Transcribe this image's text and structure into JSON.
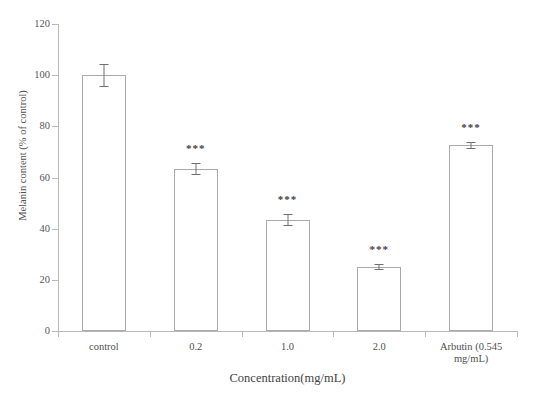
{
  "chart_data": {
    "type": "bar",
    "title": "",
    "xlabel": "Concentration(mg/mL)",
    "ylabel": "Melanin content  (% of control)",
    "categories": [
      "control",
      "0.2",
      "1.0",
      "2.0",
      "Arbutin  (0.545 mg/mL)"
    ],
    "values": [
      100,
      63.5,
      43.5,
      25.2,
      72.7
    ],
    "errors": [
      4.2,
      2.0,
      2.2,
      1.0,
      1.0
    ],
    "annotations": [
      "",
      "***",
      "***",
      "***",
      "***"
    ],
    "ylim": [
      0,
      120
    ],
    "yticks": [
      0,
      20,
      40,
      60,
      80,
      100,
      120
    ],
    "ytick_labels": [
      "0",
      "20",
      "40",
      "60",
      "80",
      "100",
      "120"
    ],
    "grid": false,
    "legend": null,
    "bar_fill": "#ffffff",
    "bar_edge": "#a9a9a9",
    "axis_color": "#b9b9b9",
    "text_color": "#4f4f4f"
  },
  "axis": {
    "x_title": "Concentration(mg/mL)",
    "y_title": "Melanin content  (% of control)"
  },
  "x_labels": [
    {
      "line1": "control",
      "line2": ""
    },
    {
      "line1": "0.2",
      "line2": ""
    },
    {
      "line1": "1.0",
      "line2": ""
    },
    {
      "line1": "2.0",
      "line2": ""
    },
    {
      "line1": "Arbutin  (0.545",
      "line2": "mg/mL)"
    }
  ],
  "y_ticks": [
    "120",
    "100",
    "80",
    "60",
    "40",
    "20",
    "0"
  ],
  "significance": {
    "marker": "***"
  }
}
